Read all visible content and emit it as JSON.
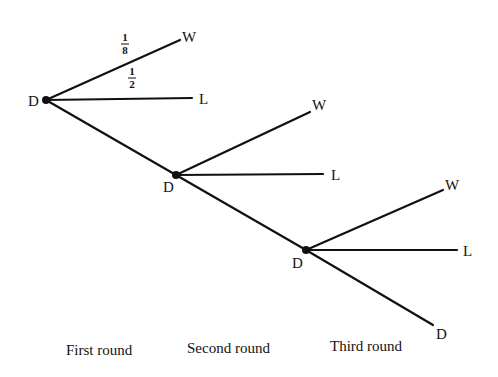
{
  "diagram": {
    "type": "probability-tree",
    "nodes": [
      {
        "id": "d1",
        "label": "D",
        "x": 46,
        "y": 100
      },
      {
        "id": "d2",
        "label": "D",
        "x": 176,
        "y": 175
      },
      {
        "id": "d3",
        "label": "D",
        "x": 306,
        "y": 250
      }
    ],
    "leaves": [
      {
        "id": "w1",
        "label": "W",
        "from": "d1",
        "x": 180,
        "y": 40
      },
      {
        "id": "l1",
        "label": "L",
        "from": "d1",
        "x": 192,
        "y": 98
      },
      {
        "id": "w2",
        "label": "W",
        "from": "d2",
        "x": 310,
        "y": 112
      },
      {
        "id": "l2",
        "label": "L",
        "from": "d2",
        "x": 323,
        "y": 174
      },
      {
        "id": "w3",
        "label": "W",
        "from": "d3",
        "x": 443,
        "y": 190
      },
      {
        "id": "l3",
        "label": "L",
        "from": "d3",
        "x": 457,
        "y": 250
      },
      {
        "id": "d4",
        "label": "D",
        "from": "d3",
        "x": 433,
        "y": 325
      }
    ],
    "probabilities": [
      {
        "branch": "d1-w1",
        "num": "1",
        "den": "8"
      },
      {
        "branch": "d1-l1",
        "num": "1",
        "den": "2"
      }
    ],
    "round_labels": [
      "First round",
      "Second round",
      "Third round"
    ]
  }
}
